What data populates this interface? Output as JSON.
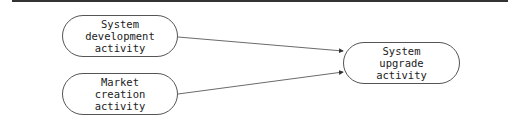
{
  "diagram": {
    "nodes": [
      {
        "id": "system-development",
        "lines": [
          "System",
          "development",
          "activity"
        ]
      },
      {
        "id": "market-creation",
        "lines": [
          "Market",
          "creation",
          "activity"
        ]
      },
      {
        "id": "system-upgrade",
        "lines": [
          "System",
          "upgrade",
          "activity"
        ]
      }
    ],
    "edges": [
      {
        "from": "system-development",
        "to": "system-upgrade"
      },
      {
        "from": "market-creation",
        "to": "system-upgrade"
      }
    ]
  }
}
